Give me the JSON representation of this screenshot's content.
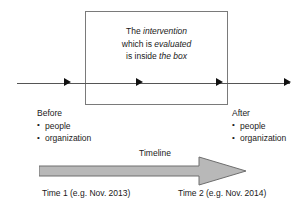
{
  "diagram": {
    "intervention_box": {
      "lines": [
        {
          "plain_before": "The ",
          "italic": "intervention",
          "plain_after": ""
        },
        {
          "plain_before": "which is ",
          "italic": "evaluated",
          "plain_after": ""
        },
        {
          "plain_before": "is inside ",
          "italic": "the box",
          "plain_after": ""
        }
      ],
      "line1_plain": "The ",
      "line1_italic": "intervention",
      "line2_plain": "which is ",
      "line2_italic": "evaluated",
      "line3_plain": "is inside ",
      "line3_italic": "the box",
      "border_color": "#7a7a7a"
    },
    "axis": {
      "color": "#555555",
      "arrowhead_color": "#111111",
      "arrowhead_count": 4
    },
    "before": {
      "heading": "Before",
      "bullets": [
        "people",
        "organization"
      ]
    },
    "after": {
      "heading": "After",
      "bullets": [
        "people",
        "organization"
      ]
    },
    "timeline": {
      "label": "Timeline",
      "fill_color": "#b8b8b8",
      "stroke_color": "#6e6e6e",
      "start_caption": "Time 1 (e.g. Nov. 2013)",
      "end_caption": "Time 2 (e.g. Nov. 2014)"
    }
  }
}
